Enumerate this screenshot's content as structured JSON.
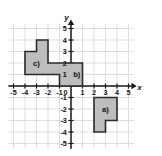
{
  "figure": {
    "title": "",
    "axis_labels": {
      "x": "x",
      "y": "y"
    },
    "colors": {
      "grid": "#d6d6d6",
      "axis": "#1a1a1a",
      "shape_fill": "#bdbdbd",
      "shape_stroke": "#2b2b2b",
      "tick_text": "#111111",
      "background": "#ffffff"
    }
  },
  "chart_data": {
    "type": "scatter",
    "title": "",
    "xlabel": "x",
    "ylabel": "y",
    "xlim": [
      -5.6,
      5.6
    ],
    "ylim": [
      -5.6,
      5.6
    ],
    "grid": true,
    "legend": "none",
    "x_ticks": [
      -5,
      -4,
      -3,
      -2,
      -1,
      0,
      1,
      2,
      3,
      4,
      5
    ],
    "y_ticks": [
      5,
      4,
      3,
      2,
      1,
      0,
      -1,
      -2,
      -3,
      -4,
      -5
    ],
    "x_tick_labels": [
      "-5",
      "-4",
      "-3",
      "-2",
      "-1",
      "0",
      "1",
      "2",
      "3",
      "4",
      "5"
    ],
    "y_tick_labels": [
      "5",
      "4",
      "3",
      "2",
      "1",
      "0",
      "-1",
      "-2",
      "-3",
      "-4",
      "-5"
    ],
    "shapes": [
      {
        "name": "a",
        "label": "a)",
        "label_position": [
          3,
          -2
        ],
        "vertices": [
          [
            2,
            -1
          ],
          [
            4,
            -1
          ],
          [
            4,
            -3
          ],
          [
            3,
            -3
          ],
          [
            3,
            -4
          ],
          [
            2,
            -4
          ]
        ]
      },
      {
        "name": "bc",
        "label_b": "b)",
        "label_b_position": [
          0.5,
          1
        ],
        "label_c": "c)",
        "label_c_position": [
          -3,
          2
        ],
        "vertices": [
          [
            -4,
            3
          ],
          [
            -3,
            3
          ],
          [
            -3,
            4
          ],
          [
            -2,
            4
          ],
          [
            -2,
            2
          ],
          [
            1,
            2
          ],
          [
            1,
            0
          ],
          [
            -1,
            0
          ],
          [
            -1,
            1
          ],
          [
            -4,
            1
          ]
        ]
      }
    ]
  },
  "labels": {
    "a": "a)",
    "b": "b)",
    "c": "c)"
  }
}
